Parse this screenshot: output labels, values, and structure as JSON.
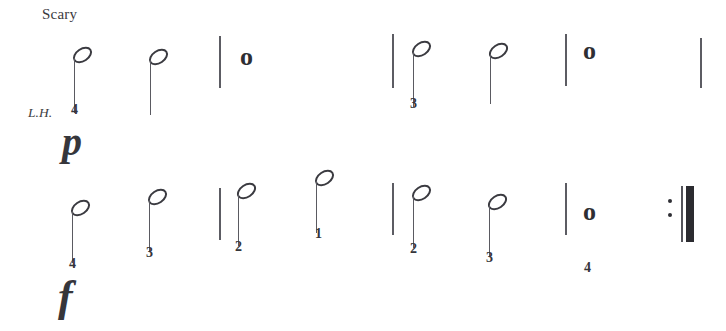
{
  "page": {
    "width": 726,
    "height": 331,
    "background": "#ffffff",
    "ink_color": "#3a3a40"
  },
  "headings": {
    "tempo_expression": "Scary",
    "hand_indication": "L.H."
  },
  "dynamics": {
    "upper_system": "p",
    "lower_system": "f"
  },
  "systems": [
    {
      "name": "upper-system",
      "dynamic": "p",
      "notes": [
        {
          "index": 1,
          "type": "half",
          "finger": "4",
          "x": 72,
          "head_y": 48,
          "stem_len": 55
        },
        {
          "index": 2,
          "type": "half",
          "finger": "",
          "x": 148,
          "head_y": 50,
          "stem_len": 55
        },
        {
          "index": 3,
          "type": "whole",
          "finger": "",
          "x": 240,
          "head_y": 48
        },
        {
          "index": 4,
          "type": "half",
          "finger": "3",
          "x": 411,
          "head_y": 42,
          "stem_len": 55
        },
        {
          "index": 5,
          "type": "half",
          "finger": "",
          "x": 488,
          "head_y": 44,
          "stem_len": 50
        },
        {
          "index": 6,
          "type": "whole",
          "finger": "",
          "x": 583,
          "head_y": 42
        }
      ],
      "barlines": [
        {
          "x": 219,
          "y": 36,
          "height": 52
        },
        {
          "x": 392,
          "y": 34,
          "height": 54
        },
        {
          "x": 565,
          "y": 34,
          "height": 52
        },
        {
          "x": 700,
          "y": 38,
          "height": 50
        }
      ]
    },
    {
      "name": "lower-system",
      "dynamic": "f",
      "notes": [
        {
          "index": 1,
          "type": "half",
          "finger": "4",
          "x": 70,
          "head_y": 201,
          "stem_len": 52
        },
        {
          "index": 2,
          "type": "half",
          "finger": "3",
          "x": 147,
          "head_y": 190,
          "stem_len": 52
        },
        {
          "index": 3,
          "type": "half",
          "finger": "2",
          "x": 236,
          "head_y": 184,
          "stem_len": 52
        },
        {
          "index": 4,
          "type": "half",
          "finger": "1",
          "x": 314,
          "head_y": 171,
          "stem_len": 52
        },
        {
          "index": 5,
          "type": "half",
          "finger": "2",
          "x": 411,
          "head_y": 186,
          "stem_len": 52
        },
        {
          "index": 6,
          "type": "half",
          "finger": "3",
          "x": 487,
          "head_y": 195,
          "stem_len": 52
        },
        {
          "index": 7,
          "type": "whole",
          "finger": "4",
          "x": 583,
          "head_y": 203
        }
      ],
      "barlines": [
        {
          "x": 219,
          "y": 188,
          "height": 52
        },
        {
          "x": 392,
          "y": 183,
          "height": 52
        },
        {
          "x": 565,
          "y": 183,
          "height": 52
        }
      ],
      "final_repeat": {
        "name": "end-repeat-barline",
        "x": 668,
        "y": 186,
        "height": 56,
        "dots": 2
      }
    }
  ],
  "label_positions": {
    "tempo_x": 42,
    "tempo_y": 6,
    "hand_x": 28,
    "hand_y": 105,
    "dyn_p_x": 62,
    "dyn_p_y": 122,
    "dyn_f_x": 58,
    "dyn_f_y": 277
  }
}
